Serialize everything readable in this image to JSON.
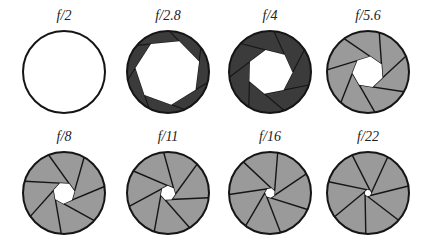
{
  "colors": {
    "outline": "#151515",
    "blade_dark": "#3b3b3b",
    "blade_light": "#9a9a9a",
    "hole": "#ffffff",
    "label": "#222222"
  },
  "apertures": [
    {
      "label": "f/2",
      "cx": 64,
      "cy": 72,
      "hole": 0,
      "shade": "none",
      "lx": 64,
      "ly": 20
    },
    {
      "label": "f/2.8",
      "cx": 168,
      "cy": 72,
      "hole": 0.8,
      "shade": "dark",
      "lx": 168,
      "ly": 20
    },
    {
      "label": "f/4",
      "cx": 270,
      "cy": 72,
      "hole": 0.55,
      "shade": "dark",
      "lx": 270,
      "ly": 20
    },
    {
      "label": "f/5.6",
      "cx": 368,
      "cy": 72,
      "hole": 0.38,
      "shade": "light",
      "lx": 368,
      "ly": 20
    },
    {
      "label": "f/8",
      "cx": 64,
      "cy": 193,
      "hole": 0.26,
      "shade": "light",
      "lx": 64,
      "ly": 141
    },
    {
      "label": "f/11",
      "cx": 168,
      "cy": 193,
      "hole": 0.18,
      "shade": "light",
      "lx": 168,
      "ly": 141
    },
    {
      "label": "f/16",
      "cx": 270,
      "cy": 193,
      "hole": 0.12,
      "shade": "light",
      "lx": 270,
      "ly": 141
    },
    {
      "label": "f/22",
      "cx": 368,
      "cy": 193,
      "hole": 0.08,
      "shade": "light",
      "lx": 368,
      "ly": 141
    }
  ],
  "radius": 41,
  "blades": 7
}
